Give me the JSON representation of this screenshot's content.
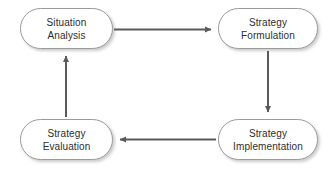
{
  "diagram": {
    "type": "cycle-flowchart",
    "background_color": "#ffffff",
    "node_border_color": "#9a9a9a",
    "node_fill_color": "#ffffff",
    "text_color": "#2e2e2e",
    "arrow_color": "#5a5a5a",
    "nodes": [
      {
        "id": "situation-analysis",
        "label": "Situation\nAnalysis",
        "line1": "Situation",
        "line2": "Analysis",
        "position": "top-left"
      },
      {
        "id": "strategy-formulation",
        "label": "Strategy\nFormulation",
        "line1": "Strategy",
        "line2": "Formulation",
        "position": "top-right"
      },
      {
        "id": "strategy-implementation",
        "label": "Strategy\nImplementation",
        "line1": "Strategy",
        "line2": "Implementation",
        "position": "bottom-right"
      },
      {
        "id": "strategy-evaluation",
        "label": "Strategy\nEvaluation",
        "line1": "Strategy",
        "line2": "Evaluation",
        "position": "bottom-left"
      }
    ],
    "arrows": [
      {
        "id": "arrow-top",
        "from": "situation-analysis",
        "to": "strategy-formulation",
        "direction": "right"
      },
      {
        "id": "arrow-right",
        "from": "strategy-formulation",
        "to": "strategy-implementation",
        "direction": "down"
      },
      {
        "id": "arrow-bottom",
        "from": "strategy-implementation",
        "to": "strategy-evaluation",
        "direction": "left"
      },
      {
        "id": "arrow-left",
        "from": "strategy-evaluation",
        "to": "situation-analysis",
        "direction": "up"
      }
    ]
  }
}
